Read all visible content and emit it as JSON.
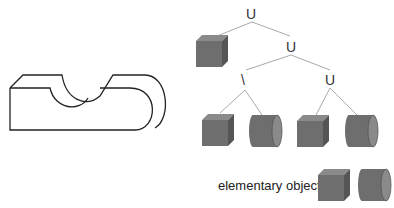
{
  "diagram": {
    "operators": {
      "root": "U",
      "mid": "U",
      "left_child": "\\",
      "right_child": "U"
    },
    "legend": {
      "label": "elementary objects",
      "items": [
        "cube",
        "cylinder"
      ]
    },
    "colors": {
      "solid_front": "#6e6e6e",
      "solid_top": "#8a8a8a",
      "solid_side": "#555555",
      "edge_line": "#aaaaaa",
      "outline": "#222222"
    }
  }
}
